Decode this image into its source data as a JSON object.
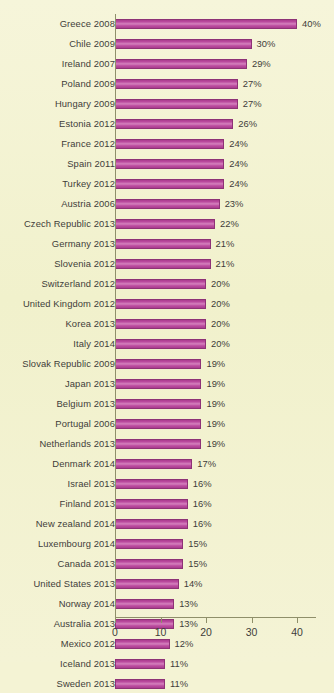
{
  "chart_data": {
    "type": "bar",
    "orientation": "horizontal",
    "title": "",
    "subtitle": "",
    "xlabel": "",
    "ylabel": "",
    "xlim": [
      0,
      44
    ],
    "grid": false,
    "legend": null,
    "value_suffix": "%",
    "axis": {
      "ticks": [
        0,
        10,
        20,
        30,
        40
      ],
      "tick_labels": [
        "0",
        "10",
        "20",
        "30",
        "40"
      ]
    },
    "colors": {
      "background": "#f2f2cc",
      "bar_fill": "#bb4a9e",
      "bar_highlight": "#d481bd",
      "bar_border": "#8e3276",
      "axis_line": "#8f8f6a",
      "text": "#3f3d3a"
    },
    "categories": [
      "Greece 2008",
      "Chile 2009",
      "Ireland 2007",
      "Poland 2009",
      "Hungary 2009",
      "Estonia 2012",
      "France 2012",
      "Spain 2011",
      "Turkey 2012",
      "Austria 2006",
      "Czech Republic 2013",
      "Germany 2013",
      "Slovenia 2012",
      "Switzerland 2012",
      "United Kingdom 2012",
      "Korea 2013",
      "Italy 2014",
      "Slovak Republic 2009",
      "Japan 2013",
      "Belgium 2013",
      "Portugal 2006",
      "Netherlands 2013",
      "Denmark 2014",
      "Israel 2013",
      "Finland 2013",
      "New zealand 2014",
      "Luxembourg 2014",
      "Canada 2013",
      "United States 2013",
      "Norway 2014",
      "Australia 2013",
      "Mexico 2012",
      "Iceland 2013",
      "Sweden 2013"
    ],
    "values": [
      40,
      30,
      29,
      27,
      27,
      26,
      24,
      24,
      24,
      23,
      22,
      21,
      21,
      20,
      20,
      20,
      20,
      19,
      19,
      19,
      19,
      19,
      17,
      16,
      16,
      16,
      15,
      15,
      14,
      13,
      13,
      12,
      11,
      11
    ],
    "value_labels": [
      "40%",
      "30%",
      "29%",
      "27%",
      "27%",
      "26%",
      "24%",
      "24%",
      "24%",
      "23%",
      "22%",
      "21%",
      "21%",
      "20%",
      "20%",
      "20%",
      "20%",
      "19%",
      "19%",
      "19%",
      "19%",
      "19%",
      "17%",
      "16%",
      "16%",
      "16%",
      "15%",
      "15%",
      "14%",
      "13%",
      "13%",
      "12%",
      "11%",
      "11%"
    ]
  }
}
